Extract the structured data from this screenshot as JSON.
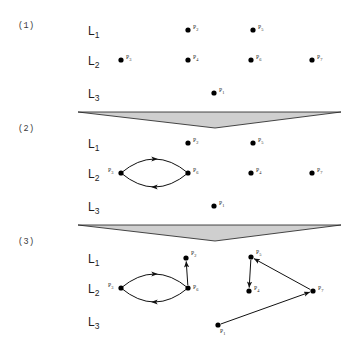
{
  "figure": {
    "kind": "layered-graph-evolution",
    "node_radius": 2.6,
    "wedge_fill": "#cfcfcf",
    "wedge_stroke": "#1a1a1a",
    "edge_color": "#111111",
    "node_color": "#000000"
  },
  "panels": [
    {
      "id": "panel-1",
      "number": "(1)",
      "number_pos": {
        "x": 18,
        "y": 21
      },
      "layers": [
        {
          "name": "L",
          "sub": "1",
          "label_pos": {
            "x": 88,
            "y": 24
          },
          "y": 30
        },
        {
          "name": "L",
          "sub": "2",
          "label_pos": {
            "x": 88,
            "y": 54
          },
          "y": 60
        },
        {
          "name": "L",
          "sub": "3",
          "label_pos": {
            "x": 88,
            "y": 87
          },
          "y": 93
        }
      ],
      "nodes": [
        {
          "id": "P2",
          "name": "P",
          "sub": "2",
          "x": 188,
          "y": 30,
          "label_dx": 5,
          "label_dy": -1
        },
        {
          "id": "P5",
          "name": "P",
          "sub": "5",
          "x": 253,
          "y": 30,
          "label_dx": 5,
          "label_dy": -1
        },
        {
          "id": "P3",
          "name": "P",
          "sub": "3",
          "x": 121,
          "y": 60,
          "label_dx": 5,
          "label_dy": -1
        },
        {
          "id": "P4",
          "name": "P",
          "sub": "4",
          "x": 188,
          "y": 60,
          "label_dx": 5,
          "label_dy": -1
        },
        {
          "id": "P6",
          "name": "P",
          "sub": "6",
          "x": 251,
          "y": 60,
          "label_dx": 5,
          "label_dy": -1
        },
        {
          "id": "P7",
          "name": "P",
          "sub": "7",
          "x": 312,
          "y": 60,
          "label_dx": 5,
          "label_dy": -1
        },
        {
          "id": "P1",
          "name": "P",
          "sub": "1",
          "x": 214,
          "y": 93,
          "label_dx": 5,
          "label_dy": -1
        }
      ],
      "edges": [],
      "cycles": [],
      "wedge": {
        "left_x": 78,
        "right_x": 341,
        "top_y": 112,
        "apex_x": 215,
        "apex_y": 128
      }
    },
    {
      "id": "panel-2",
      "number": "(2)",
      "number_pos": {
        "x": 18,
        "y": 124
      },
      "layers": [
        {
          "name": "L",
          "sub": "1",
          "label_pos": {
            "x": 88,
            "y": 137
          },
          "y": 143
        },
        {
          "name": "L",
          "sub": "2",
          "label_pos": {
            "x": 88,
            "y": 167
          },
          "y": 173
        },
        {
          "name": "L",
          "sub": "3",
          "label_pos": {
            "x": 88,
            "y": 200
          },
          "y": 206
        }
      ],
      "nodes": [
        {
          "id": "P2",
          "name": "P",
          "sub": "2",
          "x": 188,
          "y": 143,
          "label_dx": 5,
          "label_dy": -1
        },
        {
          "id": "P5",
          "name": "P",
          "sub": "5",
          "x": 253,
          "y": 143,
          "label_dx": 5,
          "label_dy": -1
        },
        {
          "id": "P3",
          "name": "P",
          "sub": "3",
          "x": 121,
          "y": 173,
          "label_dx": -13,
          "label_dy": -1
        },
        {
          "id": "P6",
          "name": "P",
          "sub": "6",
          "x": 188,
          "y": 173,
          "label_dx": 5,
          "label_dy": -1
        },
        {
          "id": "P4",
          "name": "P",
          "sub": "4",
          "x": 251,
          "y": 173,
          "label_dx": 5,
          "label_dy": -1
        },
        {
          "id": "P7",
          "name": "P",
          "sub": "7",
          "x": 312,
          "y": 173,
          "label_dx": 5,
          "label_dy": -1
        },
        {
          "id": "P1",
          "name": "P",
          "sub": "1",
          "x": 214,
          "y": 206,
          "label_dx": 5,
          "label_dy": -1
        }
      ],
      "edges": [],
      "cycles": [
        {
          "id": "cycle-p3-p6",
          "from": "P3",
          "to": "P6",
          "x1": 121,
          "y1": 173,
          "x2": 188,
          "y2": 173,
          "bulge": 14
        }
      ],
      "wedge": {
        "left_x": 78,
        "right_x": 341,
        "top_y": 225,
        "apex_x": 215,
        "apex_y": 241
      }
    },
    {
      "id": "panel-3",
      "number": "(3)",
      "number_pos": {
        "x": 18,
        "y": 237
      },
      "layers": [
        {
          "name": "L",
          "sub": "1",
          "label_pos": {
            "x": 88,
            "y": 252
          },
          "y": 258
        },
        {
          "name": "L",
          "sub": "2",
          "label_pos": {
            "x": 88,
            "y": 282
          },
          "y": 288
        },
        {
          "name": "L",
          "sub": "3",
          "label_pos": {
            "x": 88,
            "y": 315
          },
          "y": 321
        }
      ],
      "nodes": [
        {
          "id": "P2",
          "name": "P",
          "sub": "2",
          "x": 186,
          "y": 258,
          "label_dx": 5,
          "label_dy": -3
        },
        {
          "id": "P5",
          "name": "P",
          "sub": "5",
          "x": 251,
          "y": 257,
          "label_dx": 5,
          "label_dy": -3
        },
        {
          "id": "P3",
          "name": "P",
          "sub": "3",
          "x": 121,
          "y": 288,
          "label_dx": -13,
          "label_dy": -1
        },
        {
          "id": "P6",
          "name": "P",
          "sub": "6",
          "x": 188,
          "y": 288,
          "label_dx": 5,
          "label_dy": 1
        },
        {
          "id": "P4",
          "name": "P",
          "sub": "4",
          "x": 249,
          "y": 291,
          "label_dx": 5,
          "label_dy": -1
        },
        {
          "id": "P7",
          "name": "P",
          "sub": "7",
          "x": 313,
          "y": 291,
          "label_dx": 5,
          "label_dy": -1
        },
        {
          "id": "P1",
          "name": "P",
          "sub": "1",
          "x": 218,
          "y": 325,
          "label_dx": 2,
          "label_dy": 8
        }
      ],
      "edges": [
        {
          "id": "edge-p6-p2",
          "from": "P6",
          "to": "P2",
          "x1": 188,
          "y1": 288,
          "x2": 186,
          "y2": 258
        },
        {
          "id": "edge-p5-p4",
          "from": "P5",
          "to": "P4",
          "x1": 251,
          "y1": 257,
          "x2": 249,
          "y2": 291
        },
        {
          "id": "edge-p7-p5",
          "from": "P7",
          "to": "P5",
          "x1": 313,
          "y1": 291,
          "x2": 251,
          "y2": 257
        },
        {
          "id": "edge-p1-p7",
          "from": "P1",
          "to": "P7",
          "x1": 218,
          "y1": 325,
          "x2": 313,
          "y2": 291
        }
      ],
      "cycles": [
        {
          "id": "cycle-p3-p6",
          "from": "P3",
          "to": "P6",
          "x1": 121,
          "y1": 288,
          "x2": 188,
          "y2": 288,
          "bulge": 14
        }
      ],
      "wedge": null
    }
  ]
}
